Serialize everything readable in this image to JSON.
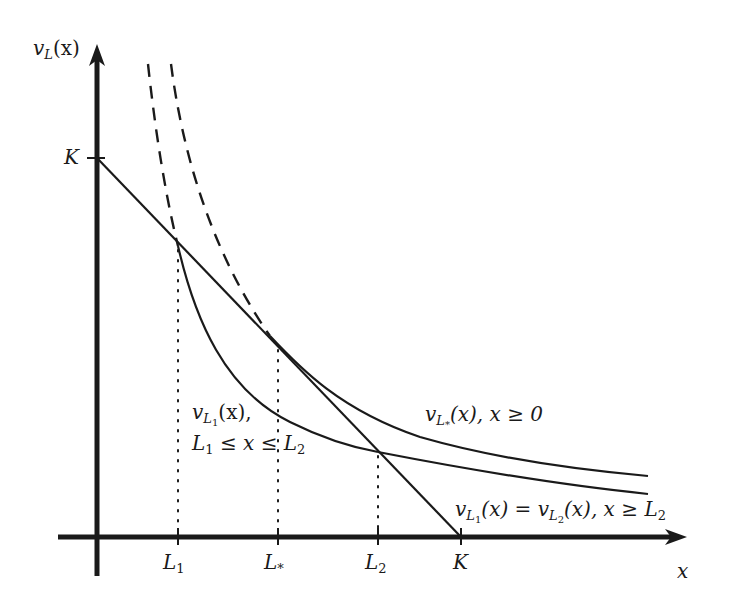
{
  "diagram": {
    "type": "function-plot",
    "axes": {
      "y_label": "v_L(x)",
      "x_label": "x",
      "y_ticks": [
        {
          "label": "K"
        }
      ],
      "x_ticks": [
        {
          "label": "L_1"
        },
        {
          "label": "L_*"
        },
        {
          "label": "L_2"
        },
        {
          "label": "K"
        }
      ]
    },
    "labels": {
      "y_axis": {
        "v": "v",
        "sub": "L",
        "arg": "(x)"
      },
      "x_axis": "x",
      "y_tick_K": "K",
      "x_tick_L1": {
        "base": "L",
        "sub": "1"
      },
      "x_tick_Lstar": {
        "base": "L",
        "sub": "*"
      },
      "x_tick_L2": {
        "base": "L",
        "sub": "2"
      },
      "x_tick_K": "K",
      "curve_vL1_line1": {
        "v": "v",
        "sub": "L",
        "subsub": "1",
        "rest": "(x),"
      },
      "curve_vL1_line2": {
        "a": "L",
        "asub": "1",
        "mid": " ≤ x ≤ ",
        "b": "L",
        "bsub": "2"
      },
      "curve_vLstar": {
        "v": "v",
        "sub": "L",
        "subsub": "*",
        "rest": "(x), x ≥ 0"
      },
      "curve_equal": {
        "v1": "v",
        "sub1": "L",
        "subsub1": "1",
        "mid": "(x) = ",
        "v2": "v",
        "sub2": "L",
        "subsub2": "2",
        "rest": "(x), x ≥ ",
        "end": "L",
        "endsub": "2"
      }
    },
    "elements": [
      {
        "name": "payoff-line",
        "description": "straight line from (0,K) to (K,0)",
        "style": "solid"
      },
      {
        "name": "curve-vLstar",
        "description": "smooth curve tangent to payoff line at L*",
        "style": "solid"
      },
      {
        "name": "curve-vL1",
        "description": "curve from L1 crossing payoff line, meets at L2",
        "style": "solid"
      },
      {
        "name": "dashed-extensions",
        "description": "dashed continuations of the two curves above",
        "style": "dashed"
      },
      {
        "name": "dotted-guides",
        "description": "vertical dotted lines at L1, L*, L2",
        "style": "dotted"
      }
    ],
    "colors": {
      "ink": "#1a1a1a",
      "background": "#ffffff"
    }
  }
}
